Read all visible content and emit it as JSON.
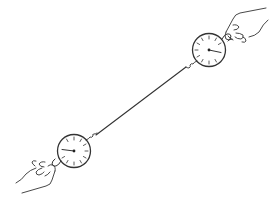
{
  "figure": {
    "colors": {
      "stroke": "#333333",
      "background": "#ffffff"
    },
    "scales": [
      {
        "id": "top-right-scale",
        "cx": 209,
        "cy": 50,
        "r": 16,
        "needle_angle_deg": 12
      },
      {
        "id": "bottom-left-scale",
        "cx": 74,
        "cy": 151,
        "r": 16,
        "needle_angle_deg": 186
      }
    ],
    "string": {
      "x1": 186,
      "y1": 67,
      "x2": 96,
      "y2": 135
    },
    "hands": [
      {
        "id": "right-hand",
        "position": "top-right"
      },
      {
        "id": "left-hand",
        "position": "bottom-left"
      }
    ]
  }
}
